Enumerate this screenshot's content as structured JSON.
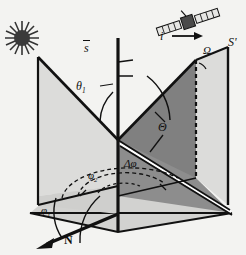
{
  "figure": {
    "background_color": "#f3f3f1",
    "width": 246,
    "height": 255
  },
  "palette": {
    "plane_light": "#dcdcda",
    "plane_light2": "#d2d2d0",
    "plane_dark": "#808080",
    "plane_mid": "#8d8d8d",
    "line": "#111111",
    "white_edge": "#ffffff"
  },
  "labels": {
    "sun_vector": "s",
    "sun_vector_accent": "vector-arrow",
    "incidence_angle": "θ",
    "incidence_angle_sub": "1",
    "view_vector": "i",
    "relative_azimuth_cap": "Ω",
    "sensor_plane": "S'",
    "scattering_angle": "Θ",
    "azimuth_difference": "Δφ",
    "azimuth_two": "φ",
    "azimuth_two_sub": "2",
    "azimuth_one": "φ",
    "azimuth_one_sub": "1",
    "north_direction": "N"
  },
  "elements": {
    "sun": "sun-starburst-icon",
    "satellite": "satellite-icon",
    "north_arrow": "north-arrow",
    "vertical_axis": "zenith-axis",
    "dashed_edge": "dashed-vertical-edge",
    "azimuth_arcs": "dashed-azimuth-arcs"
  },
  "geometry": {
    "origin_x": 118,
    "origin_y": 140,
    "axis_top_y": 38,
    "axis_bottom_y": 232
  }
}
